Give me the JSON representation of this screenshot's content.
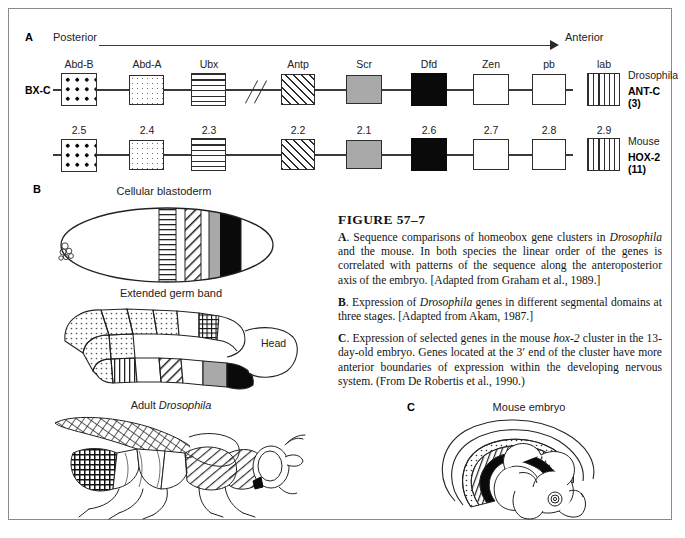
{
  "figure": {
    "number": "FIGURE  57–7",
    "paragraphs": [
      {
        "label": "A",
        "text": " Sequence comparisons of homeobox gene clusters in Drosophila and the mouse. In both species the linear order of the genes is correlated with patterns of the sequence along the anteroposterior axis of the embryo. [Adapted from Graham et al., 1989.]"
      },
      {
        "label": "B",
        "text": " Expression of Drosophila genes in different segmental domains at three stages. [Adapted from Akam, 1987.]"
      },
      {
        "label": "C",
        "text": " Expression of selected genes in the mouse hox-2 cluster in the 13-day-old embryo. Genes located at the 3' end of the cluster have more anterior boundaries of expression within the developing nervous system. (From De Robertis et al., 1990.)"
      }
    ]
  },
  "panel_a": {
    "letter": "A",
    "axis_left_label": "Posterior",
    "axis_right_label": "Anterior",
    "rows": [
      {
        "left_tag": "BX-C",
        "species": "Drosophila",
        "cluster": "ANT-C (3)",
        "genes": [
          {
            "name": "Abd-B",
            "pattern": "dots"
          },
          {
            "name": "Abd-A",
            "pattern": "stipple"
          },
          {
            "name": "Ubx",
            "pattern": "horizontal-lines"
          },
          {
            "name": "Antp",
            "pattern": "diagonal-hatch"
          },
          {
            "name": "Scr",
            "pattern": "gray"
          },
          {
            "name": "Dfd",
            "pattern": "black"
          },
          {
            "name": "Zen",
            "pattern": "white"
          },
          {
            "name": "pb",
            "pattern": "white"
          },
          {
            "name": "lab",
            "pattern": "vertical-lines"
          }
        ]
      },
      {
        "left_tag": "",
        "species": "Mouse",
        "cluster": "HOX-2 (11)",
        "genes": [
          {
            "name": "2.5",
            "pattern": "dots"
          },
          {
            "name": "2.4",
            "pattern": "stipple"
          },
          {
            "name": "2.3",
            "pattern": "horizontal-lines"
          },
          {
            "name": "2.2",
            "pattern": "diagonal-hatch"
          },
          {
            "name": "2.1",
            "pattern": "gray"
          },
          {
            "name": "2.6",
            "pattern": "black"
          },
          {
            "name": "2.7",
            "pattern": "white"
          },
          {
            "name": "2.8",
            "pattern": "white"
          },
          {
            "name": "2.9",
            "pattern": "vertical-lines"
          }
        ]
      }
    ]
  },
  "panel_b": {
    "letter": "B",
    "stages": [
      {
        "title": "Cellular blastoderm"
      },
      {
        "title": "Extended germ band",
        "annotation": "Head"
      },
      {
        "title": "Adult Drosophila"
      }
    ]
  },
  "panel_c": {
    "letter": "C",
    "title": "Mouse embryo"
  },
  "colors": {
    "ink": "#1a1a1a",
    "line": "#2d2d2d",
    "gray_fill": "#a9a9a9",
    "black_fill": "#0a0a0a",
    "frame": "#8a8a8a"
  }
}
